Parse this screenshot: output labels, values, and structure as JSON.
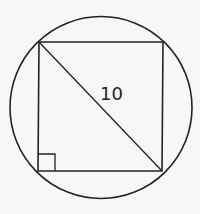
{
  "diagram": {
    "diagonal_label": "10",
    "colors": {
      "background": "#f7f7f7",
      "stroke": "#222222"
    },
    "circle": {
      "cx": 101,
      "cy": 107.5,
      "r": 91
    },
    "square": {
      "top_left": [
        39,
        42
      ],
      "top_right": [
        163,
        42
      ],
      "bottom_right": [
        162,
        171
      ],
      "bottom_left": [
        38,
        171
      ]
    },
    "right_angle_marker": {
      "x": 38,
      "y": 154,
      "size": 17
    }
  }
}
